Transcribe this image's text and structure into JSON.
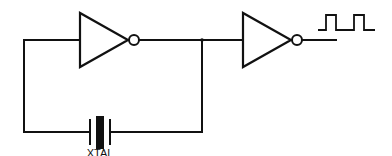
{
  "diagram": {
    "type": "crystal-oscillator-circuit",
    "components": [
      {
        "id": "inverter-1",
        "kind": "inverter"
      },
      {
        "id": "inverter-2",
        "kind": "inverter"
      },
      {
        "id": "crystal",
        "kind": "crystal",
        "label": "XTAL"
      }
    ],
    "output_signal": "square-wave",
    "labels": {
      "crystal": "XTAL"
    }
  }
}
